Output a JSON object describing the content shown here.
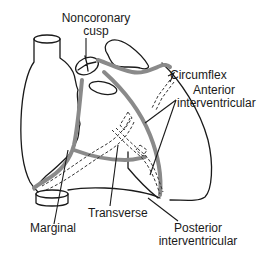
{
  "figure": {
    "colors": {
      "outline": "#1a1a1a",
      "vessel": "#8a8a8a",
      "background": "#ffffff"
    }
  },
  "labels": {
    "noncoronary_cusp": [
      "Noncoronary",
      "cusp"
    ],
    "circumflex": "Circumflex",
    "anterior_interventricular": [
      "Anterior",
      "interventricular"
    ],
    "marginal": "Marginal",
    "transverse": "Transverse",
    "posterior_interventricular": [
      "Posterior",
      "interventricular"
    ]
  }
}
